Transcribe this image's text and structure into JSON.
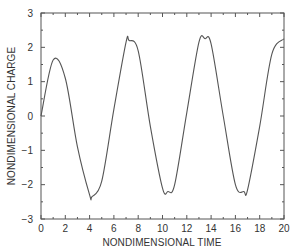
{
  "chart_data": {
    "type": "line",
    "title": "",
    "xlabel": "NONDIMENSIONAL TIME",
    "ylabel": "NONDIMENSIONAL CHARGE",
    "xlim": [
      0,
      20
    ],
    "ylim": [
      -3,
      3
    ],
    "x_ticks": [
      0,
      2,
      4,
      6,
      8,
      10,
      12,
      14,
      16,
      18,
      20
    ],
    "y_ticks": [
      -3,
      -2,
      -1,
      0,
      1,
      2,
      3
    ],
    "grid": false,
    "legend": null,
    "series": [
      {
        "name": "charge",
        "color": "#555555",
        "x": [
          0,
          1,
          2,
          3,
          4,
          5,
          6,
          7,
          8,
          9,
          10,
          11,
          12,
          13,
          14,
          15,
          16,
          17,
          18,
          19,
          20
        ],
        "values": [
          0,
          1.63,
          1.1,
          -0.9,
          -2.3,
          -1.9,
          0.2,
          2.15,
          1.9,
          -0.3,
          -2.1,
          -2.0,
          0.1,
          2.15,
          2.1,
          0.0,
          -2.0,
          -2.15,
          -0.3,
          1.8,
          2.25
        ]
      }
    ],
    "extrema": {
      "peaks": [
        {
          "t": 1.15,
          "v": 1.65
        },
        {
          "t": 7.25,
          "v": 2.2
        },
        {
          "t": 13.5,
          "v": 2.25
        }
      ],
      "troughs": [
        {
          "t": 4.2,
          "v": -2.35
        },
        {
          "t": 10.45,
          "v": -2.2
        },
        {
          "t": 16.7,
          "v": -2.2
        }
      ]
    }
  }
}
